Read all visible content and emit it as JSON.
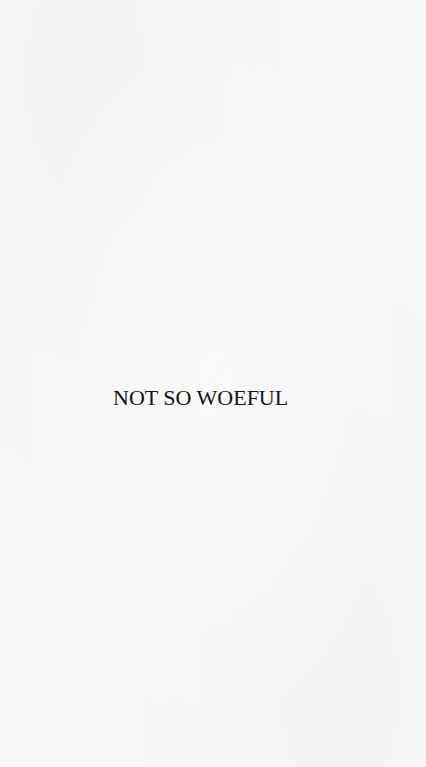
{
  "page": {
    "title": "NOT SO WOEFUL",
    "background_color": "#f8f8f8",
    "text_color": "#141414"
  }
}
